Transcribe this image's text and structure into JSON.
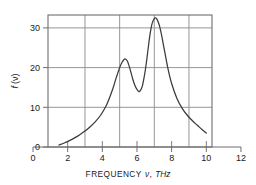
{
  "chart_data": {
    "type": "line",
    "title": "",
    "xlabel": "FREQUENCY ν, THz",
    "xlabel_main": "FREQUENCY",
    "xlabel_symbol": "ν",
    "xlabel_comma": ",",
    "xlabel_unit": "THz",
    "ylabel": "f (ν)",
    "ylabel_fn": "f",
    "ylabel_arg": "(ν)",
    "xlim": [
      0,
      12
    ],
    "ylim": [
      0,
      35
    ],
    "frame_xlim": [
      1,
      11
    ],
    "frame_ylim": [
      0,
      35
    ],
    "grid": true,
    "grid_color": "#8a8a8a",
    "line_color": "#3a3a3a",
    "axis_color": "#6e6e6e",
    "background": "#ffffff",
    "legend": null,
    "legend_position": "none",
    "xticks": [
      0,
      2,
      4,
      6,
      8,
      10,
      12
    ],
    "xtick_labels": [
      "0",
      "2",
      "4",
      "6",
      "8",
      "10",
      "12"
    ],
    "yticks": [
      0,
      10,
      20,
      30
    ],
    "ytick_labels": [
      "0",
      "10",
      "20",
      "30"
    ],
    "x_gridlines": [
      3,
      5,
      7,
      9
    ],
    "y_gridlines": [
      10,
      20,
      30
    ],
    "annotations": [],
    "features": {
      "curve_start_x": 1.5,
      "curve_start_y": 0.5,
      "curve_end_x": 10.0,
      "curve_end_y": 3.5,
      "peak1_x": 5.3,
      "peak1_y": 22.2,
      "valley_x": 6.1,
      "valley_y": 14.0,
      "peak2_x": 7.0,
      "peak2_y": 32.5
    },
    "x": [
      1.5,
      1.8,
      2.1,
      2.4,
      2.7,
      3.0,
      3.3,
      3.6,
      3.9,
      4.2,
      4.4,
      4.6,
      4.8,
      5.0,
      5.15,
      5.3,
      5.45,
      5.6,
      5.75,
      5.9,
      6.05,
      6.15,
      6.3,
      6.45,
      6.55,
      6.65,
      6.75,
      6.85,
      6.95,
      7.05,
      7.15,
      7.3,
      7.45,
      7.6,
      7.8,
      8.0,
      8.3,
      8.6,
      8.9,
      9.2,
      9.5,
      9.75,
      10.0
    ],
    "y": [
      0.5,
      1.0,
      1.6,
      2.3,
      3.1,
      4.0,
      5.1,
      6.4,
      8.0,
      10.2,
      12.2,
      14.6,
      17.4,
      20.0,
      21.4,
      22.2,
      21.6,
      19.6,
      17.2,
      15.3,
      14.2,
      14.0,
      15.2,
      18.5,
      21.5,
      25.0,
      28.3,
      30.7,
      32.0,
      32.5,
      32.2,
      30.5,
      27.5,
      24.0,
      19.5,
      16.0,
      12.3,
      9.8,
      8.0,
      6.6,
      5.4,
      4.4,
      3.5
    ],
    "series": [
      {
        "name": "f(ν)",
        "x": [
          1.5,
          1.8,
          2.1,
          2.4,
          2.7,
          3.0,
          3.3,
          3.6,
          3.9,
          4.2,
          4.4,
          4.6,
          4.8,
          5.0,
          5.15,
          5.3,
          5.45,
          5.6,
          5.75,
          5.9,
          6.05,
          6.15,
          6.3,
          6.45,
          6.55,
          6.65,
          6.75,
          6.85,
          6.95,
          7.05,
          7.15,
          7.3,
          7.45,
          7.6,
          7.8,
          8.0,
          8.3,
          8.6,
          8.9,
          9.2,
          9.5,
          9.75,
          10.0
        ],
        "values": [
          0.5,
          1.0,
          1.6,
          2.3,
          3.1,
          4.0,
          5.1,
          6.4,
          8.0,
          10.2,
          12.2,
          14.6,
          17.4,
          20.0,
          21.4,
          22.2,
          21.6,
          19.6,
          17.2,
          15.3,
          14.2,
          14.0,
          15.2,
          18.5,
          21.5,
          25.0,
          28.3,
          30.7,
          32.0,
          32.5,
          32.2,
          30.5,
          27.5,
          24.0,
          19.5,
          16.0,
          12.3,
          9.8,
          8.0,
          6.6,
          5.4,
          4.4,
          3.5
        ]
      }
    ]
  }
}
